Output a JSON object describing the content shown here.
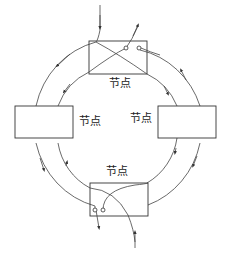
{
  "diagram": {
    "type": "dual-ring-network",
    "nodes": [
      {
        "id": "top",
        "label": "节点"
      },
      {
        "id": "left",
        "label": "节点"
      },
      {
        "id": "right",
        "label": "节点"
      },
      {
        "id": "bottom",
        "label": "节点"
      }
    ],
    "rings": [
      {
        "id": "outer",
        "direction": "counter-clockwise"
      },
      {
        "id": "inner",
        "direction": "clockwise"
      }
    ],
    "colors": {
      "stroke": "#333333",
      "background": "#ffffff"
    }
  }
}
